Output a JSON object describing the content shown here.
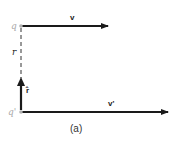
{
  "diagram": {
    "charges": {
      "top": "q",
      "bottom": "q'"
    },
    "vectors": {
      "top_velocity": "v",
      "bottom_velocity": "v'",
      "unit_vector": "r̂"
    },
    "separation_label": "r",
    "caption": "(a)",
    "colors": {
      "line": "#1a1a1a",
      "charge": "#b0b0b0"
    }
  }
}
